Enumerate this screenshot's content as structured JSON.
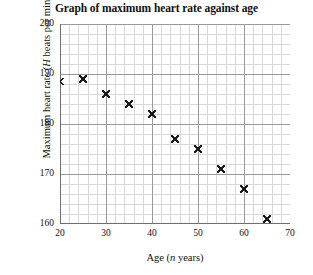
{
  "chart_data": {
    "type": "scatter",
    "title": "Graph of maximum heart rate against age",
    "xlabel": "Age (n years)",
    "xlabel_parts": {
      "prefix": "Age (",
      "variable": "n",
      "suffix": " years)"
    },
    "ylabel": "Maximum heart rate (H beats per minute)",
    "ylabel_parts": {
      "prefix": "Maximum heart rate (",
      "variable": "H",
      "suffix": " beats per minute)"
    },
    "xlim": [
      20,
      70
    ],
    "ylim": [
      160,
      200
    ],
    "xticks": [
      20,
      30,
      40,
      50,
      60,
      70
    ],
    "yticks": [
      160,
      170,
      180,
      190,
      200
    ],
    "x_major_step": 10,
    "y_major_step": 10,
    "x_minor_step": 2,
    "y_minor_step": 2,
    "grid": true,
    "grid_major_color": "#9a9a9a",
    "grid_minor_color": "#d8d8d8",
    "axis_color": "#6e6e6e",
    "marker": "x",
    "marker_color": "#1a1a1a",
    "legend": null,
    "x": [
      20,
      25,
      30,
      35,
      40,
      45,
      50,
      55,
      60,
      65
    ],
    "y": [
      188.5,
      189,
      186,
      184,
      182,
      177,
      175,
      171,
      167,
      161
    ],
    "points": [
      {
        "age": 20,
        "heart_rate": 188.5
      },
      {
        "age": 25,
        "heart_rate": 189
      },
      {
        "age": 30,
        "heart_rate": 186
      },
      {
        "age": 35,
        "heart_rate": 184
      },
      {
        "age": 40,
        "heart_rate": 182
      },
      {
        "age": 45,
        "heart_rate": 177
      },
      {
        "age": 50,
        "heart_rate": 175
      },
      {
        "age": 55,
        "heart_rate": 171
      },
      {
        "age": 60,
        "heart_rate": 167
      },
      {
        "age": 65,
        "heart_rate": 161
      }
    ]
  }
}
